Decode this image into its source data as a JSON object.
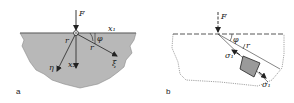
{
  "figure": {
    "panels": [
      {
        "id": "a",
        "label": "a",
        "force_label": "F",
        "axis_labels": {
          "x1": "x₁",
          "x2": "x₂",
          "xi": "ξ",
          "eta": "η"
        },
        "radius_label": "r",
        "angle_label": "φ",
        "fill_color": "#b8b8b8"
      },
      {
        "id": "b",
        "label": "b",
        "force_label": "F",
        "angle_label": "φ",
        "radius_label": "r",
        "stress_label_inner": "σ₁",
        "stress_label_outer": "σ₁",
        "element_color": "#9a9a9a"
      }
    ]
  }
}
